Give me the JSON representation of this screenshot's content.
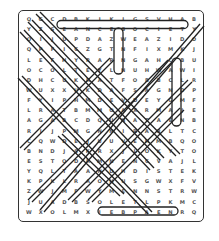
{
  "puzzle": {
    "type": "word-search",
    "columns": 15,
    "rows": 20,
    "grid": [
      "QGCDBKIKIGSVHAB",
      "YZSEANCESOCIETY",
      "OIJUPDAZWEAZIDO",
      "QPFICZGTNFIXMKJ",
      "LEFHYRARNGAHCBU",
      "OCOLTEYLNUHWAWI",
      "DHCUKRATFOBBCLR",
      "WUXXUKDAFSAGNDP",
      "FYIPHMDEVDEYGMF",
      "LRATBMMOAXRMAJE",
      "AGABCDQUNATAENB",
      "RIJPMGNNIRARLTC",
      "CQWDEJUUVEHMBQO",
      "BNDJSKRXJLOKYTO",
      "ESTODRMNENCVAJL",
      "YQLTAANDHDISTEK",
      "KPKLRAOHUSGWXFV",
      "ZWJMFWYMENNSTRW",
      "JUADBSOLETLPKMC",
      "WXOLMXIEBPAENRQ"
    ],
    "highlighted_words": [
      {
        "word": "SEANCESOCIETY",
        "direction": "horizontal"
      },
      {
        "word": "MYSTERIES",
        "direction": "horizontal"
      },
      {
        "word": "vertical-col8",
        "direction": "vertical"
      },
      {
        "word": "vertical-col13",
        "direction": "vertical"
      }
    ],
    "bottom_row": "ESTWWZMIMYSTERIESWE"
  }
}
